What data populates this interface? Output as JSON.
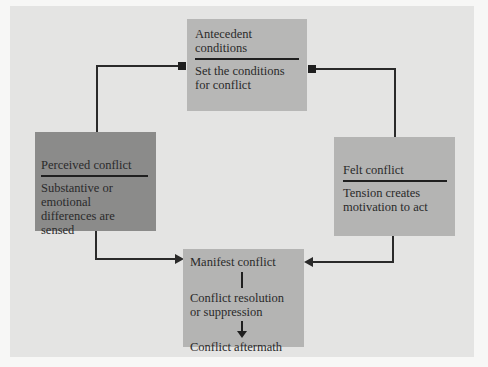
{
  "diagram": {
    "colors": {
      "page_background": "#f7f7f6",
      "panel_background": "#e4e4e3",
      "antecedent_box": "#b7b7b6",
      "perceived_box": "#8b8b8a",
      "felt_box": "#b4b4b3",
      "manifest_box": "#b4b4b3",
      "line": "#2a2a2a"
    },
    "nodes": {
      "antecedent": {
        "title": "Antecedent conditions",
        "desc": "Set the conditions for conflict"
      },
      "perceived": {
        "title": "Perceived conflict",
        "desc": "Substantive or emotional differences are sensed"
      },
      "felt": {
        "title": "Felt conflict",
        "desc": "Tension creates motivation to act"
      },
      "manifest": {
        "steps": [
          "Manifest conflict",
          "Conflict resolution or suppression",
          "Conflict aftermath"
        ]
      }
    },
    "edges": [
      {
        "from": "antecedent",
        "to": "perceived"
      },
      {
        "from": "antecedent",
        "to": "felt"
      },
      {
        "from": "perceived",
        "to": "manifest"
      },
      {
        "from": "felt",
        "to": "manifest"
      }
    ]
  }
}
